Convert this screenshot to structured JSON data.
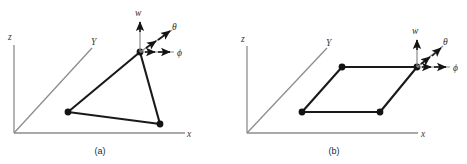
{
  "figure": {
    "title": "",
    "background": "#ffffff",
    "width": 467,
    "height": 164,
    "colors": {
      "axis": "#8d8d8d",
      "edge": "#1a1a1a",
      "node": "#141414",
      "vector_thin": "#8a8a8a",
      "vector_dark": "#1a1a1a",
      "label": "#2b2b2b"
    }
  },
  "panels": [
    {
      "id": "a",
      "caption": "(a)",
      "axes": {
        "z_label": "z",
        "y_label": "Y",
        "x_label": "x"
      },
      "vectors": [
        {
          "name": "w",
          "label": "w",
          "direction": "up"
        },
        {
          "name": "theta",
          "label": "θ",
          "direction": "up-right-diagonal"
        },
        {
          "name": "phi",
          "label": "ϕ",
          "direction": "right"
        }
      ],
      "shape": {
        "type": "triangle",
        "vertices": [
          {
            "name": "apex",
            "x": 140,
            "y": 52
          },
          {
            "name": "lower-left",
            "x": 68,
            "y": 112
          },
          {
            "name": "lower-right",
            "x": 160,
            "y": 124
          }
        ]
      }
    },
    {
      "id": "b",
      "caption": "(b)",
      "axes": {
        "z_label": "z",
        "y_label": "Y",
        "x_label": "x"
      },
      "vectors": [
        {
          "name": "w",
          "label": "w",
          "direction": "up"
        },
        {
          "name": "theta",
          "label": "θ",
          "direction": "up-right-diagonal"
        },
        {
          "name": "phi",
          "label": "ϕ",
          "direction": "right"
        }
      ],
      "shape": {
        "type": "parallelogram",
        "vertices": [
          {
            "name": "top-right",
            "x": 417,
            "y": 67
          },
          {
            "name": "top-left",
            "x": 342,
            "y": 67
          },
          {
            "name": "bottom-left",
            "x": 302,
            "y": 112
          },
          {
            "name": "bottom-right",
            "x": 380,
            "y": 112
          }
        ]
      }
    }
  ]
}
